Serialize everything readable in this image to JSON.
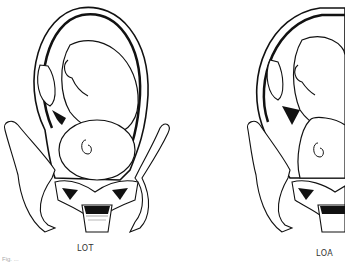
{
  "figure": {
    "panels": [
      {
        "label": "LOT",
        "description": "fetus in pelvis, left occiput transverse"
      },
      {
        "label": "LOA",
        "description": "fetus in pelvis, left occiput anterior"
      }
    ],
    "caption_fragment": "Fig. ..."
  }
}
